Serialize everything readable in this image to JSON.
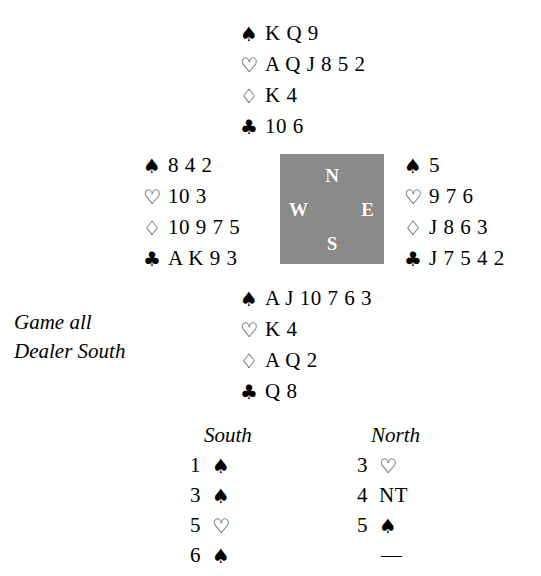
{
  "diagram": {
    "type": "bridge-deal",
    "suit_glyphs": {
      "spade": "♠",
      "heart": "♡",
      "diamond": "♢",
      "club": "♣"
    },
    "colors": {
      "ink": "#000000",
      "paper": "#ffffff",
      "compass_fill": "#8a8a8a",
      "compass_text": "#ffffff"
    }
  },
  "hands": {
    "north": {
      "seat": "North",
      "spades_symbol": "♠",
      "hearts_symbol": "♡",
      "diamonds_symbol": "♢",
      "clubs_symbol": "♣",
      "spades": "K Q 9",
      "hearts": "A Q J 8 5 2",
      "diamonds": "K 4",
      "clubs": "10 6"
    },
    "west": {
      "seat": "West",
      "spades_symbol": "♠",
      "hearts_symbol": "♡",
      "diamonds_symbol": "♢",
      "clubs_symbol": "♣",
      "spades": "8 4 2",
      "hearts": "10 3",
      "diamonds": "10 9 7 5",
      "clubs": "A K 9 3"
    },
    "east": {
      "seat": "East",
      "spades_symbol": "♠",
      "hearts_symbol": "♡",
      "diamonds_symbol": "♢",
      "clubs_symbol": "♣",
      "spades": "5",
      "hearts": "9 7 6",
      "diamonds": "J 8 6 3",
      "clubs": "J 7 5 4 2"
    },
    "south": {
      "seat": "South",
      "spades_symbol": "♠",
      "hearts_symbol": "♡",
      "diamonds_symbol": "♢",
      "clubs_symbol": "♣",
      "spades": "A J 10 7 6 3",
      "hearts": "K 4",
      "diamonds": "A Q 2",
      "clubs": "Q 8"
    }
  },
  "compass": {
    "north": "N",
    "south": "S",
    "east": "E",
    "west": "W"
  },
  "conditions": {
    "vulnerability": "Game all",
    "dealer": "Dealer South"
  },
  "auction": {
    "south_heading": "South",
    "north_heading": "North",
    "south_bids": [
      {
        "level": "1",
        "denom": "♠"
      },
      {
        "level": "3",
        "denom": "♠"
      },
      {
        "level": "5",
        "denom": "♡"
      },
      {
        "level": "6",
        "denom": "♠"
      }
    ],
    "north_bids": [
      {
        "level": "3",
        "denom": "♡"
      },
      {
        "level": "4",
        "denom": "NT"
      },
      {
        "level": "5",
        "denom": "♠"
      },
      {
        "level": "",
        "denom": "—"
      }
    ]
  }
}
